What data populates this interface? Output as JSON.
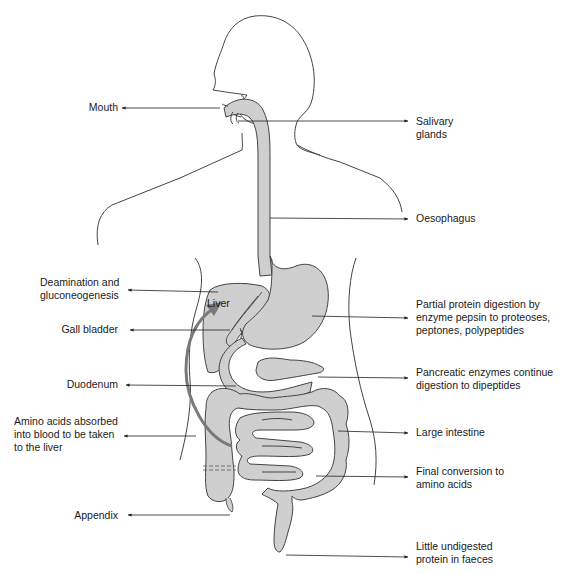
{
  "diagram": {
    "colors": {
      "organ_fill": "#cfcfcf",
      "outline": "#444444",
      "arrow": "#7a7a7a",
      "text": "#1a1a1a",
      "background": "#ffffff"
    },
    "organ_labels": {
      "liver": "Liver"
    },
    "left_labels": [
      {
        "id": "mouth",
        "lines": [
          "Mouth"
        ]
      },
      {
        "id": "deamination",
        "lines": [
          "Deamination and",
          "gluconeogenesis"
        ]
      },
      {
        "id": "gall-bladder",
        "lines": [
          "Gall bladder"
        ]
      },
      {
        "id": "duodenum",
        "lines": [
          "Duodenum"
        ]
      },
      {
        "id": "amino-acids-absorbed",
        "lines": [
          "Amino acids absorbed",
          "into blood to be taken",
          "to the liver"
        ]
      },
      {
        "id": "appendix",
        "lines": [
          "Appendix"
        ]
      }
    ],
    "right_labels": [
      {
        "id": "salivary-glands",
        "lines": [
          "Salivary",
          "glands"
        ]
      },
      {
        "id": "oesophagus",
        "lines": [
          "Oesophagus"
        ]
      },
      {
        "id": "stomach-digestion",
        "lines": [
          "Partial protein digestion by",
          "enzyme pepsin to proteoses,",
          "peptones, polypeptides"
        ]
      },
      {
        "id": "pancreatic-enzymes",
        "lines": [
          "Pancreatic enzymes continue",
          "digestion to dipeptides"
        ]
      },
      {
        "id": "large-intestine",
        "lines": [
          "Large intestine"
        ]
      },
      {
        "id": "final-conversion",
        "lines": [
          "Final conversion to",
          "amino acids"
        ]
      },
      {
        "id": "undigested-protein",
        "lines": [
          "Little undigested",
          "protein in faeces"
        ]
      }
    ]
  }
}
